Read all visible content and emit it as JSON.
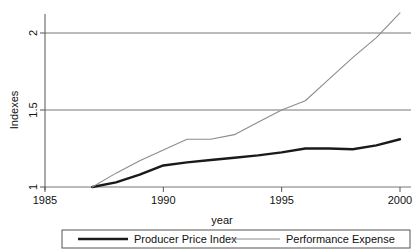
{
  "chart_data": {
    "type": "line",
    "title": "",
    "xlabel": "year",
    "ylabel": "Indexes",
    "xlim": [
      1985,
      2000
    ],
    "ylim": [
      1,
      2.2
    ],
    "xticks": [
      1985,
      1990,
      1995,
      2000
    ],
    "xtick_labels": [
      "1985",
      "1990",
      "1995",
      "2000"
    ],
    "yticks": [
      1,
      1.5,
      2
    ],
    "ytick_labels": [
      "1",
      "1.5",
      "2"
    ],
    "grid": "horizontal",
    "legend_position": "bottom",
    "x": [
      1987,
      1988,
      1989,
      1990,
      1991,
      1992,
      1993,
      1994,
      1995,
      1996,
      1997,
      1998,
      1999,
      2000
    ],
    "series": [
      {
        "name": "Producer Price Index",
        "color": "#1a1a1a",
        "line_width": 2.4,
        "values": [
          1.0,
          1.03,
          1.08,
          1.14,
          1.16,
          1.175,
          1.19,
          1.205,
          1.225,
          1.25,
          1.25,
          1.245,
          1.27,
          1.31
        ]
      },
      {
        "name": "Performance Expense",
        "color": "#8c8c8c",
        "line_width": 1.1,
        "values": [
          1.0,
          1.09,
          1.17,
          1.24,
          1.31,
          1.31,
          1.34,
          1.42,
          1.5,
          1.56,
          1.7,
          1.84,
          1.97,
          2.13
        ]
      }
    ]
  },
  "legend": {
    "items": [
      {
        "label": "Producer Price Index"
      },
      {
        "label": "Performance Expense"
      }
    ]
  },
  "axes": {
    "y_title": "Indexes",
    "x_title": "year"
  },
  "colors": {
    "series_primary": "#1a1a1a",
    "series_secondary": "#8c8c8c",
    "axis": "#555555",
    "grid": "#777777",
    "background": "#ffffff"
  }
}
